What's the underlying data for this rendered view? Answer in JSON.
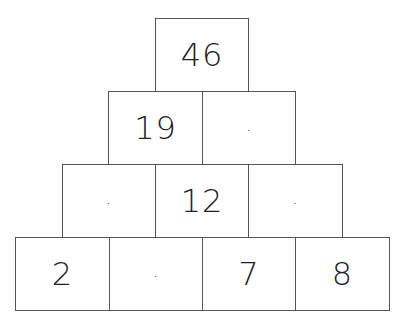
{
  "pyramid": {
    "rows": [
      {
        "cells": [
          {
            "value": "46"
          }
        ]
      },
      {
        "cells": [
          {
            "value": "19"
          },
          {
            "value": "·"
          }
        ]
      },
      {
        "cells": [
          {
            "value": "·"
          },
          {
            "value": "12"
          },
          {
            "value": "·"
          }
        ]
      },
      {
        "cells": [
          {
            "value": "2"
          },
          {
            "value": "·"
          },
          {
            "value": "7"
          },
          {
            "value": "8"
          }
        ]
      }
    ]
  }
}
